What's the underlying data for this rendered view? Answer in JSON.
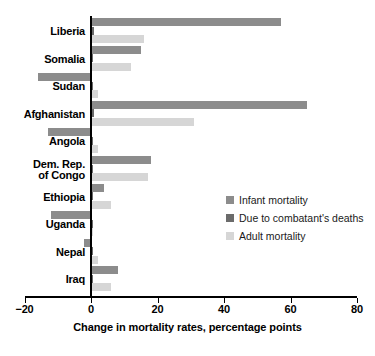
{
  "chart_data": {
    "type": "bar",
    "orientation": "horizontal",
    "title": "",
    "xlabel": "Change in mortality rates, percentage points",
    "ylabel": "",
    "xlim": [
      -20,
      80
    ],
    "xticks": [
      -20,
      0,
      20,
      40,
      60,
      80
    ],
    "xtick_labels": [
      "−20",
      "0",
      "20",
      "40",
      "60",
      "80"
    ],
    "grid": false,
    "legend_position": "center-right",
    "categories": [
      "Liberia",
      "Somalia",
      "Sudan",
      "Afghanistan",
      "Angola",
      "Dem. Rep. of Congo",
      "Ethiopia",
      "Uganda",
      "Nepal",
      "Iraq"
    ],
    "category_lines": [
      [
        "Liberia"
      ],
      [
        "Somalia"
      ],
      [
        "Sudan"
      ],
      [
        "Afghanistan"
      ],
      [
        "Angola"
      ],
      [
        "Dem. Rep.",
        "of Congo"
      ],
      [
        "Ethiopia"
      ],
      [
        "Uganda"
      ],
      [
        "Nepal"
      ],
      [
        "Iraq"
      ]
    ],
    "series": [
      {
        "name": "Infant mortality",
        "color": "#8c8c8c",
        "values": [
          57,
          15,
          -16,
          65,
          -13,
          18,
          4,
          -12,
          -2,
          8
        ]
      },
      {
        "name": "Due to combatant's deaths",
        "color": "#6b6b6b",
        "values": [
          1,
          0.4,
          0.3,
          1,
          0.3,
          0.5,
          0.3,
          0.3,
          0.3,
          0.4
        ]
      },
      {
        "name": "Adult mortality",
        "color": "#d6d6d6",
        "values": [
          16,
          12,
          2,
          31,
          2,
          17,
          6,
          0.5,
          2,
          6
        ]
      }
    ]
  },
  "legend": {
    "items": [
      {
        "label": "Infant mortality",
        "swatch": "infant"
      },
      {
        "label": "Due to combatant's deaths",
        "swatch": "combat"
      },
      {
        "label": "Adult mortality",
        "swatch": "adult"
      }
    ]
  }
}
